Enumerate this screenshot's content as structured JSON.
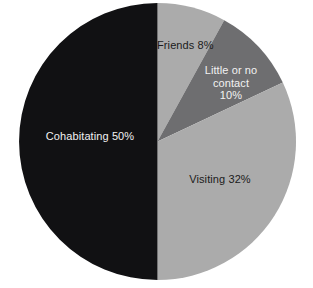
{
  "background_color": "#ffffff",
  "chart_data": {
    "type": "pie",
    "title": "",
    "subtitle": "",
    "xlabel": "",
    "ylabel": "",
    "grid": false,
    "legend_position": "none",
    "labels_inside_slices": true,
    "start_angle_deg_from_top": 0,
    "direction": "clockwise",
    "center": {
      "x": 157.5,
      "y": 141.5
    },
    "radius": 138.5,
    "categories": [
      "Friends",
      "Little or no contact",
      "Visiting",
      "Cohabitating"
    ],
    "values": [
      8,
      10,
      32,
      50
    ],
    "unit": "%",
    "colors": [
      "#ababab",
      "#6e6e70",
      "#ababab",
      "#111113"
    ],
    "slices": [
      {
        "name": "Friends",
        "value": 8,
        "label": "Friends 8%",
        "color": "#ababab",
        "text_color": "#1b1b1b",
        "start_angle_deg": 0,
        "end_angle_deg": 28.8
      },
      {
        "name": "Little or no contact",
        "value": 10,
        "label_line_1": "Little or no",
        "label_line_2": "contact",
        "label_line_3": "10%",
        "color": "#6e6e70",
        "text_color": "#f2f2f2",
        "start_angle_deg": 28.8,
        "end_angle_deg": 64.8
      },
      {
        "name": "Visiting",
        "value": 32,
        "label": "Visiting 32%",
        "color": "#ababab",
        "text_color": "#1b1b1b",
        "start_angle_deg": 64.8,
        "end_angle_deg": 180
      },
      {
        "name": "Cohabitating",
        "value": 50,
        "label": "Cohabitating 50%",
        "color": "#111113",
        "text_color": "#f2f2f2",
        "start_angle_deg": 180,
        "end_angle_deg": 360
      }
    ]
  }
}
